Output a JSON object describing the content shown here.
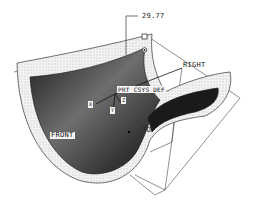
{
  "viewport": {
    "background": "#ffffff",
    "surface_color_dark": "#1a1a1a",
    "surface_color_light": "#9a9a9a",
    "offset_band_color": "#e9e9e9",
    "line_color": "#333333"
  },
  "dimension": {
    "value": "29.77"
  },
  "datum_planes": {
    "front": "FRONT",
    "right": "RIGHT",
    "top": "TOP"
  },
  "coordinate_system": {
    "label": "PRT_CSYS_DEF",
    "axes": [
      "X",
      "Y",
      "Z"
    ]
  }
}
